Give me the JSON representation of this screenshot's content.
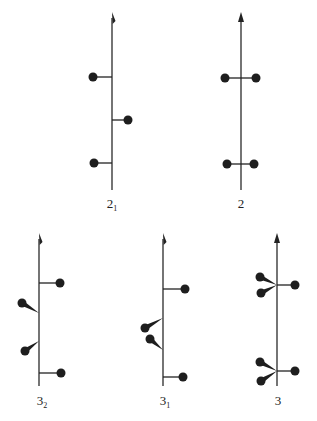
{
  "figure": {
    "panels": [
      {
        "id": "2_1",
        "label": "2",
        "subscript": "1",
        "axis": {
          "x": 112,
          "top": 12,
          "bottom": 190
        },
        "arrow_style": "half",
        "branches": [
          {
            "type": "arm",
            "from": [
              112,
              77
            ],
            "to": [
              93,
              77
            ]
          },
          {
            "type": "arm",
            "from": [
              112,
              120
            ],
            "to": [
              128,
              120
            ]
          },
          {
            "type": "arm",
            "from": [
              112,
              163
            ],
            "to": [
              94,
              163
            ]
          }
        ],
        "label_pos": [
          112,
          208
        ]
      },
      {
        "id": "2",
        "label": "2",
        "subscript": "",
        "axis": {
          "x": 241,
          "top": 12,
          "bottom": 190
        },
        "arrow_style": "full",
        "branches": [
          {
            "type": "arm",
            "from": [
              241,
              78
            ],
            "to": [
              225,
              78
            ]
          },
          {
            "type": "arm",
            "from": [
              241,
              78
            ],
            "to": [
              256,
              78
            ]
          },
          {
            "type": "arm",
            "from": [
              241,
              164
            ],
            "to": [
              227,
              164
            ]
          },
          {
            "type": "arm",
            "from": [
              241,
              164
            ],
            "to": [
              254,
              164
            ]
          }
        ],
        "label_pos": [
          241,
          208
        ]
      },
      {
        "id": "3_2",
        "label": "3",
        "subscript": "2",
        "axis": {
          "x": 39,
          "top": 233,
          "bottom": 386
        },
        "arrow_style": "half",
        "branches": [
          {
            "type": "arm",
            "from": [
              39,
              283
            ],
            "to": [
              60,
              283
            ]
          },
          {
            "type": "wedge",
            "from": [
              39,
              313
            ],
            "to": [
              22,
              303
            ]
          },
          {
            "type": "wedge",
            "from": [
              39,
              341
            ],
            "to": [
              25,
              351
            ]
          },
          {
            "type": "arm",
            "from": [
              39,
              373
            ],
            "to": [
              61,
              373
            ]
          }
        ],
        "label_pos": [
          42,
          405
        ]
      },
      {
        "id": "3_1",
        "label": "3",
        "subscript": "1",
        "axis": {
          "x": 163,
          "top": 233,
          "bottom": 386
        },
        "arrow_style": "half",
        "branches": [
          {
            "type": "arm",
            "from": [
              163,
              289
            ],
            "to": [
              185,
              289
            ]
          },
          {
            "type": "wedge",
            "from": [
              163,
              318
            ],
            "to": [
              145,
              328
            ]
          },
          {
            "type": "wedge",
            "from": [
              163,
              350
            ],
            "to": [
              150,
              339
            ]
          },
          {
            "type": "arm",
            "from": [
              163,
              377
            ],
            "to": [
              183,
              377
            ]
          }
        ],
        "label_pos": [
          165,
          405
        ]
      },
      {
        "id": "3",
        "label": "3",
        "subscript": "",
        "axis": {
          "x": 277,
          "top": 233,
          "bottom": 386
        },
        "arrow_style": "full",
        "branches": [
          {
            "type": "wedge",
            "from": [
              277,
              285
            ],
            "to": [
              260,
              277
            ]
          },
          {
            "type": "wedge",
            "from": [
              277,
              285
            ],
            "to": [
              261,
              293
            ]
          },
          {
            "type": "arm",
            "from": [
              277,
              285
            ],
            "to": [
              295,
              285
            ]
          },
          {
            "type": "wedge",
            "from": [
              277,
              371
            ],
            "to": [
              260,
              362
            ]
          },
          {
            "type": "wedge",
            "from": [
              277,
              371
            ],
            "to": [
              261,
              381
            ]
          },
          {
            "type": "arm",
            "from": [
              277,
              371
            ],
            "to": [
              295,
              371
            ]
          }
        ],
        "label_pos": [
          278,
          405
        ]
      }
    ],
    "colors": {
      "ink": "#1e1e1e",
      "background": "#ffffff"
    },
    "dot_radius": 4.5
  }
}
